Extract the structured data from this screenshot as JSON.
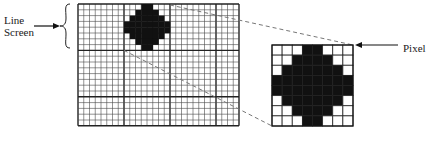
{
  "labels": {
    "line_screen_line1": "Line",
    "line_screen_line2": "Screen",
    "pixel": "Pixel"
  },
  "main_grid": {
    "x": 78,
    "y": 4,
    "cols": 28,
    "rows": 21,
    "cell_w": 5.75,
    "cell_h": 5.8,
    "major_every": 8,
    "line_color": "#4a4a4a",
    "major_line_color": "#222222"
  },
  "dot_pattern": [
    [
      0,
      0,
      0,
      1,
      1,
      0,
      0,
      0
    ],
    [
      0,
      0,
      1,
      1,
      1,
      1,
      0,
      0
    ],
    [
      0,
      1,
      1,
      1,
      1,
      1,
      1,
      0
    ],
    [
      1,
      1,
      1,
      1,
      1,
      1,
      1,
      1
    ],
    [
      1,
      1,
      1,
      1,
      1,
      1,
      1,
      1
    ],
    [
      0,
      1,
      1,
      1,
      1,
      1,
      1,
      0
    ],
    [
      0,
      0,
      1,
      1,
      1,
      1,
      0,
      0
    ],
    [
      0,
      0,
      0,
      1,
      1,
      0,
      0,
      0
    ]
  ],
  "dot_position": {
    "col": 8,
    "row": 0
  },
  "enlarged_pixel": {
    "x": 272,
    "y": 45,
    "size": 81,
    "cells": 8
  },
  "colors": {
    "ink": "#111111",
    "paper": "#ffffff",
    "dashed": "#777777"
  }
}
